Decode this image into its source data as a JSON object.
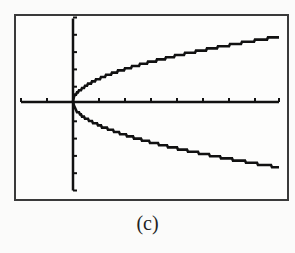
{
  "caption": "(c)",
  "colors": {
    "ink": "#111111",
    "frame": "#3a3a3a",
    "background": "#fbfbfa"
  },
  "chart_data": {
    "type": "line",
    "title": "",
    "xlabel": "",
    "ylabel": "",
    "caption": "(c)",
    "xlim": [
      -2,
      8
    ],
    "ylim": [
      -5,
      5
    ],
    "xscale": 1,
    "yscale": 1,
    "grid": false,
    "legend": null,
    "series": [
      {
        "name": "upper branch",
        "x": [
          0,
          0.5,
          1,
          2,
          3,
          4,
          5,
          6,
          7,
          8
        ],
        "y": [
          0,
          0.95,
          1.34,
          1.9,
          2.32,
          2.68,
          3.0,
          3.29,
          3.55,
          3.79
        ]
      },
      {
        "name": "lower branch",
        "x": [
          0,
          0.5,
          1,
          2,
          3,
          4,
          5,
          6,
          7,
          8
        ],
        "y": [
          0,
          -0.95,
          -1.34,
          -1.9,
          -2.32,
          -2.68,
          -3.0,
          -3.29,
          -3.55,
          -3.79
        ]
      }
    ],
    "plot_region_px": {
      "x0": 20,
      "x1": 279,
      "y0": 17,
      "y1": 190,
      "origin_x": 73,
      "origin_y": 102
    }
  }
}
